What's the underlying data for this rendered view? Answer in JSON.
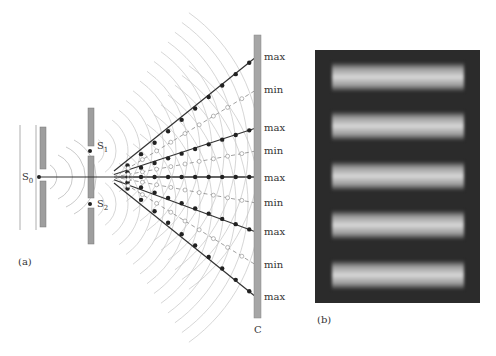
{
  "panel_a": {
    "label": "(a)",
    "source_label": "S",
    "source_sub": "0",
    "slit1_label": "S",
    "slit1_sub": "1",
    "slit2_label": "S",
    "slit2_sub": "2",
    "screen_label": "C",
    "screen_labels": [
      "max",
      "min",
      "max",
      "min",
      "max",
      "min",
      "max",
      "min",
      "max"
    ]
  },
  "panel_b": {
    "label": "(b)",
    "bright_fringes": 5
  },
  "colors": {
    "barrier": "#9e9e9e",
    "line": "#333333",
    "wave": "#bdbdbd",
    "photo_bg": "#2b2b2b"
  }
}
